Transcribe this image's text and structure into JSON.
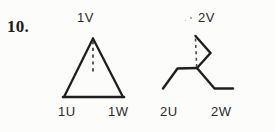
{
  "page": {
    "item_number": "10.",
    "background_color": "#fcfcfa",
    "ink_color": "#1e1e1e"
  },
  "figures": [
    {
      "id": "figure-1",
      "name": "triangle-configuration",
      "shape": "triangle",
      "labels": {
        "apex": "1V",
        "bottom_left": "1U",
        "bottom_right": "1W"
      },
      "dashed_axis": true
    },
    {
      "id": "figure-2",
      "name": "folded-configuration",
      "shape": "folded-bent",
      "labels": {
        "apex": "2V",
        "bottom_left": "2U",
        "bottom_right": "2W"
      },
      "dashed_axis": true
    }
  ]
}
